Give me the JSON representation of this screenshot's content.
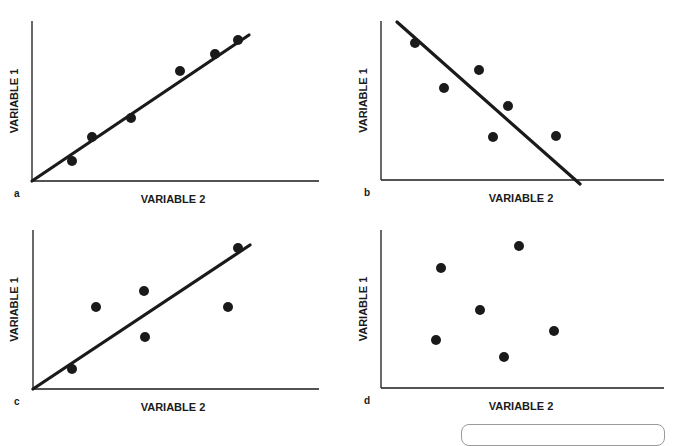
{
  "chart_data": [
    {
      "type": "scatter",
      "panel_label": "a",
      "xlabel": "VARIABLE 2",
      "ylabel": "VARIABLE 1",
      "description": "strong positive correlation",
      "axis_px": {
        "x0": 32,
        "y0": 181,
        "xmax": 319,
        "ytop": 21
      },
      "points": [
        [
          72,
          161
        ],
        [
          92,
          137
        ],
        [
          131,
          118
        ],
        [
          180,
          71
        ],
        [
          215,
          54
        ],
        [
          238,
          40
        ]
      ],
      "trend_line": [
        [
          32,
          181
        ],
        [
          249,
          35
        ]
      ],
      "grid": false
    },
    {
      "type": "scatter",
      "panel_label": "b",
      "xlabel": "VARIABLE 2",
      "ylabel": "VARIABLE 1",
      "description": "negative correlation",
      "axis_px": {
        "x0": 381,
        "y0": 180,
        "xmax": 664,
        "ytop": 21
      },
      "points": [
        [
          415,
          43
        ],
        [
          444,
          88
        ],
        [
          479,
          70
        ],
        [
          508,
          106
        ],
        [
          493,
          137
        ],
        [
          556,
          136
        ]
      ],
      "trend_line": [
        [
          397,
          22
        ],
        [
          580,
          184
        ]
      ],
      "grid": false
    },
    {
      "type": "scatter",
      "panel_label": "c",
      "xlabel": "VARIABLE 2",
      "ylabel": "VARIABLE 1",
      "description": "weak positive correlation",
      "axis_px": {
        "x0": 33,
        "y0": 389,
        "xmax": 319,
        "ytop": 230
      },
      "points": [
        [
          72,
          369
        ],
        [
          96,
          307
        ],
        [
          144,
          291
        ],
        [
          145,
          337
        ],
        [
          228,
          307
        ],
        [
          238,
          248
        ]
      ],
      "trend_line": [
        [
          33,
          389
        ],
        [
          250,
          245
        ]
      ],
      "grid": false
    },
    {
      "type": "scatter",
      "panel_label": "d",
      "xlabel": "VARIABLE 2",
      "ylabel": "VARIABLE 1",
      "description": "no correlation",
      "axis_px": {
        "x0": 381,
        "y0": 388,
        "xmax": 664,
        "ytop": 230
      },
      "points": [
        [
          441,
          268
        ],
        [
          519,
          246
        ],
        [
          480,
          310
        ],
        [
          436,
          340
        ],
        [
          504,
          357
        ],
        [
          554,
          331
        ]
      ],
      "trend_line": null,
      "grid": false
    }
  ],
  "labels": {
    "x_axis": "VARIABLE 2",
    "y_axis": "VARIABLE 1",
    "panels": [
      "a",
      "b",
      "c",
      "d"
    ]
  },
  "colors": {
    "ink": "#1a1a1a",
    "background": "#ffffff"
  }
}
